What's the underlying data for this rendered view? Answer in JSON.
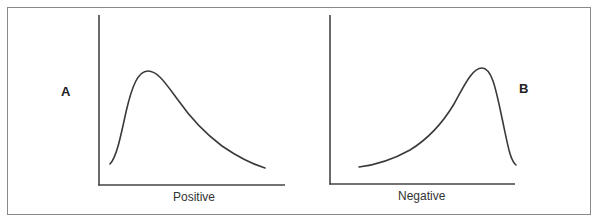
{
  "figure": {
    "panels": [
      {
        "id": "A",
        "letter": "A",
        "axis_label": "Positive",
        "description": "Positively skewed distribution curve"
      },
      {
        "id": "B",
        "letter": "B",
        "axis_label": "Negative",
        "description": "Negatively skewed distribution curve"
      }
    ]
  },
  "colors": {
    "line": "#3a3a3a",
    "axis": "#444444",
    "border": "#8a8a8a",
    "background": "#ffffff"
  }
}
